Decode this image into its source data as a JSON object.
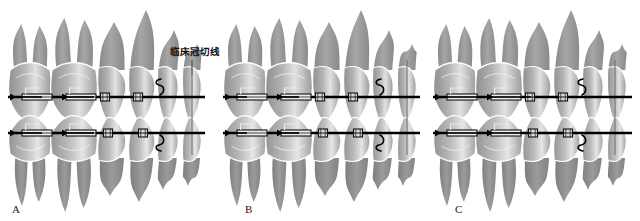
{
  "figure": {
    "title": "",
    "background_color": "#ffffff",
    "annotation": {
      "text": "临床冠切线",
      "meaning": "clinical-crown-incisal-line",
      "x": 170,
      "y": 52
    }
  },
  "colors": {
    "tooth_light": "#d7d7d7",
    "tooth_mid": "#a8a8a8",
    "tooth_dark": "#8d8d8d",
    "root_gray": "#9a9a9a",
    "crown_outline": "#ffffff",
    "wire_black": "#000000",
    "bracket_gray": "#6f6f6f",
    "reference_line": "#6a6a6a",
    "text_black": "#101010"
  },
  "panels": [
    {
      "id": "A",
      "label": "A",
      "label_x": 12,
      "label_y": 213,
      "origin_x": 0,
      "anchorage": "maximum-anchorage",
      "upper_arch": {
        "wire_y": 97,
        "wire_x1": 8,
        "wire_x2": 205,
        "arrow_length": 32,
        "arrow_direction": "left",
        "hook_x": 160,
        "brackets_x": [
          18,
          62,
          105,
          138
        ],
        "tubes_x": [
          22,
          66
        ]
      },
      "lower_arch": {
        "wire_y": 133,
        "wire_x1": 8,
        "wire_x2": 205,
        "arrow_length": 32,
        "arrow_direction": "left",
        "hook_x": 160,
        "brackets_x": [
          18,
          62,
          108,
          143
        ],
        "tubes_x": [
          22,
          66
        ]
      },
      "reference_line_x": 192,
      "teeth_count": 6
    },
    {
      "id": "B",
      "label": "B",
      "label_x": 245,
      "label_y": 213,
      "origin_x": 215,
      "anchorage": "moderate-anchorage",
      "upper_arch": {
        "wire_y": 97,
        "wire_x1": 223,
        "wire_x2": 420,
        "arrow_length": 22,
        "arrow_direction": "left",
        "hook_x": 380,
        "brackets_x": [
          233,
          277,
          320,
          353
        ],
        "tubes_x": [
          237,
          281
        ]
      },
      "lower_arch": {
        "wire_y": 133,
        "wire_x1": 223,
        "wire_x2": 420,
        "arrow_length": 22,
        "arrow_direction": "left",
        "hook_x": 380,
        "brackets_x": [
          233,
          277,
          323,
          358
        ],
        "tubes_x": [
          237,
          281
        ]
      },
      "reference_line_x": 407,
      "teeth_count": 6
    },
    {
      "id": "C",
      "label": "C",
      "label_x": 455,
      "label_y": 213,
      "origin_x": 425,
      "anchorage": "minimum-anchorage",
      "upper_arch": {
        "wire_y": 97,
        "wire_x1": 433,
        "wire_x2": 632,
        "arrow_length": 44,
        "arrow_direction": "left",
        "hook_x": 582,
        "brackets_x": [
          443,
          487,
          530,
          563
        ],
        "tubes_x": [
          447,
          491
        ]
      },
      "lower_arch": {
        "wire_y": 133,
        "wire_x1": 433,
        "wire_x2": 632,
        "arrow_length": 44,
        "arrow_direction": "left",
        "hook_x": 582,
        "brackets_x": [
          443,
          487,
          533,
          568
        ],
        "tubes_x": [
          447,
          491
        ]
      },
      "reference_line_x": 615,
      "teeth_count": 6
    }
  ],
  "legend_items": [
    {
      "name": "archwire",
      "label": "archwire"
    },
    {
      "name": "bracket",
      "label": "bracket"
    },
    {
      "name": "molar-tube",
      "label": "molar tube"
    },
    {
      "name": "retraction-arrow",
      "label": "retraction force arrow"
    },
    {
      "name": "hook",
      "label": "hook"
    }
  ]
}
